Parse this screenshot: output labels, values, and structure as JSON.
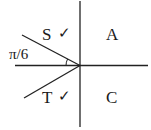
{
  "diagram": {
    "type": "CAST quadrant diagram",
    "quadrants": {
      "top_left": "S",
      "top_right": "A",
      "bottom_left": "T",
      "bottom_right": "C"
    },
    "top_left_mark": "✓",
    "bottom_left_mark": "✓",
    "angle_label": "π/6"
  }
}
